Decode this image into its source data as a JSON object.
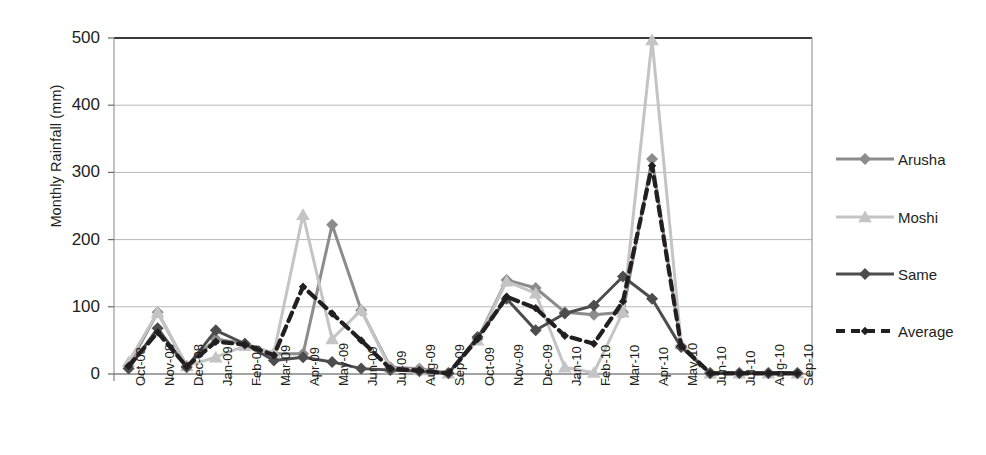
{
  "chart_data": {
    "type": "line",
    "title": "",
    "xlabel": "",
    "ylabel": "Monthly Rainfall (mm)",
    "ylim": [
      0,
      500
    ],
    "yticks": [
      0,
      100,
      200,
      300,
      400,
      500
    ],
    "grid": true,
    "legend_position": "right",
    "categories": [
      "Oct-08",
      "Nov-08",
      "Dec-08",
      "Jan-09",
      "Feb-09",
      "Mar-09",
      "Apr-09",
      "May-09",
      "Jun-09",
      "Jul-09",
      "Aug-09",
      "Sep-09",
      "Oct-09",
      "Nov-09",
      "Dec-09",
      "Jan-10",
      "Feb-10",
      "Mar-10",
      "Apr-10",
      "May-10",
      "Jun-10",
      "Jul-10",
      "Aug-10",
      "Sep-10"
    ],
    "series": [
      {
        "name": "Arusha",
        "color": "#8c8c8c",
        "marker": "diamond",
        "dashed": false,
        "values": [
          12,
          92,
          12,
          52,
          45,
          30,
          30,
          222,
          95,
          10,
          8,
          2,
          52,
          140,
          128,
          92,
          88,
          92,
          320,
          42,
          2,
          2,
          2,
          2
        ]
      },
      {
        "name": "Moshi",
        "color": "#c4c4c4",
        "marker": "triangle",
        "dashed": false,
        "values": [
          18,
          92,
          12,
          25,
          42,
          32,
          237,
          52,
          95,
          8,
          6,
          1,
          50,
          138,
          120,
          10,
          2,
          92,
          497,
          45,
          1,
          1,
          1,
          1
        ]
      },
      {
        "name": "Same",
        "color": "#4d4d4d",
        "marker": "diamond",
        "dashed": false,
        "values": [
          8,
          68,
          10,
          65,
          45,
          20,
          25,
          18,
          8,
          6,
          4,
          1,
          55,
          112,
          65,
          90,
          102,
          145,
          112,
          40,
          1,
          1,
          1,
          1
        ]
      },
      {
        "name": "Average",
        "color": "#231f20",
        "marker": "small-diamond",
        "dashed": true,
        "values": [
          12,
          62,
          11,
          48,
          44,
          28,
          130,
          90,
          50,
          8,
          5,
          1,
          52,
          115,
          98,
          57,
          45,
          108,
          310,
          42,
          1,
          1,
          1,
          1
        ]
      }
    ]
  },
  "legend": {
    "items": [
      {
        "label": "Arusha"
      },
      {
        "label": "Moshi"
      },
      {
        "label": "Same"
      },
      {
        "label": "Average"
      }
    ]
  }
}
